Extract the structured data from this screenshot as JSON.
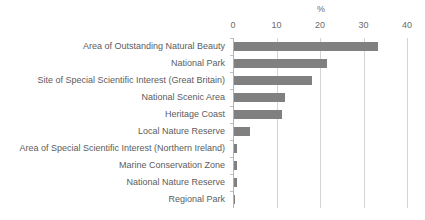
{
  "chart_data": {
    "type": "bar",
    "orientation": "horizontal",
    "title": "",
    "xlabel": "%",
    "ylabel": "",
    "xlim": [
      0,
      40
    ],
    "xticks": [
      0,
      10,
      20,
      30,
      40
    ],
    "xtick_labels": [
      "0",
      "10",
      "20",
      "30",
      "40"
    ],
    "grid": true,
    "legend": false,
    "bar_color": "#808080",
    "gridline_color": "#d4d4d4",
    "text_color": "#5c5c5c",
    "categories": [
      "Area of Outstanding Natural Beauty",
      "National Park",
      "Site of Special Scientific Interest (Great Britain)",
      "National Scenic Area",
      "Heritage Coast",
      "Local Nature Reserve",
      "Area of Special Scientific Interest (Northern Ireland)",
      "Marine Conservation Zone",
      "National Nature Reserve",
      "Regional Park"
    ],
    "values": [
      33.2,
      21.3,
      18.0,
      11.8,
      11.0,
      3.7,
      0.6,
      0.6,
      0.6,
      0.3
    ]
  }
}
